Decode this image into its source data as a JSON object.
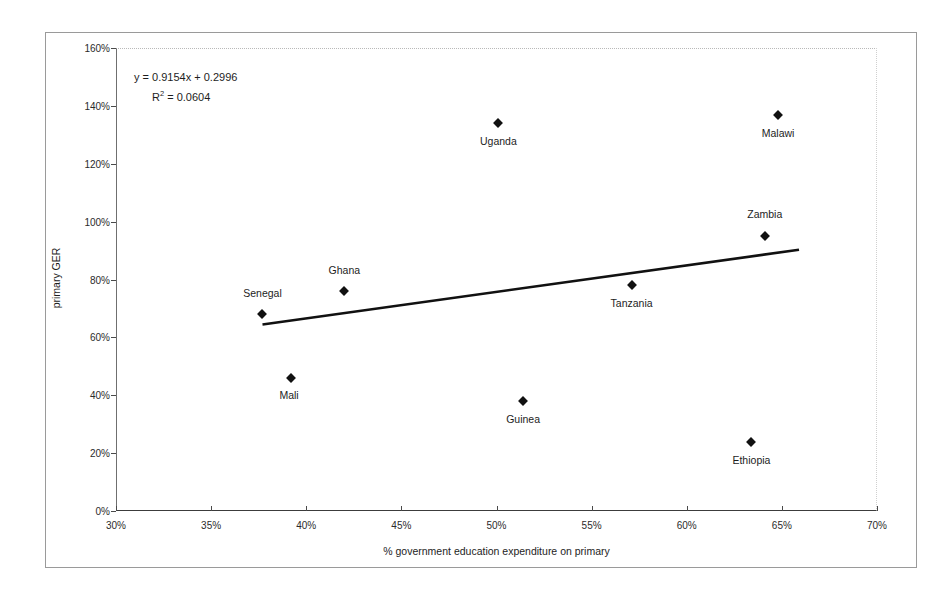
{
  "chart_data": {
    "type": "scatter",
    "title": "",
    "xlabel": "% government education expenditure on primary",
    "ylabel": "primary GER",
    "xlim": [
      30,
      70
    ],
    "ylim": [
      0,
      160
    ],
    "xticks": [
      "30%",
      "35%",
      "40%",
      "45%",
      "50%",
      "55%",
      "60%",
      "65%",
      "70%"
    ],
    "xtick_values": [
      30,
      35,
      40,
      45,
      50,
      55,
      60,
      65,
      70
    ],
    "yticks": [
      "0%",
      "20%",
      "40%",
      "60%",
      "80%",
      "100%",
      "120%",
      "140%",
      "160%"
    ],
    "ytick_values": [
      0,
      20,
      40,
      60,
      80,
      100,
      120,
      140,
      160
    ],
    "grid": false,
    "legend": "none",
    "points": [
      {
        "label": "Senegal",
        "x": 37.7,
        "y": 68,
        "label_dx": 0,
        "label_dy": -20
      },
      {
        "label": "Mali",
        "x": 39.2,
        "y": 46,
        "label_dx": -2,
        "label_dy": 18
      },
      {
        "label": "Ghana",
        "x": 42.0,
        "y": 76,
        "label_dx": 0,
        "label_dy": -20
      },
      {
        "label": "Uganda",
        "x": 50.1,
        "y": 134,
        "label_dx": 0,
        "label_dy": 19
      },
      {
        "label": "Guinea",
        "x": 51.4,
        "y": 38,
        "label_dx": 0,
        "label_dy": 19
      },
      {
        "label": "Tanzania",
        "x": 57.1,
        "y": 78,
        "label_dx": 0,
        "label_dy": 19
      },
      {
        "label": "Ethiopia",
        "x": 63.4,
        "y": 24,
        "label_dx": 0,
        "label_dy": 19
      },
      {
        "label": "Zambia",
        "x": 64.1,
        "y": 95,
        "label_dx": 0,
        "label_dy": -21
      },
      {
        "label": "Malawi",
        "x": 64.8,
        "y": 137,
        "label_dx": 0,
        "label_dy": 19
      }
    ],
    "trendline": {
      "slope": 0.9154,
      "intercept": 0.2996,
      "x_start": 37.7,
      "x_end": 65.9,
      "color": "#111111",
      "width": 2.6
    },
    "annotations": {
      "equation": "y = 0.9154x + 0.2996",
      "r_squared_prefix": "R",
      "r_squared_exponent": "2",
      "r_squared_value": " = 0.0604"
    }
  },
  "colors": {
    "marker": "#111111",
    "trendline": "#111111",
    "axis": "#3c3c3c",
    "frame": "#9a9a9a",
    "text": "#1d1d1d",
    "background": "#ffffff"
  }
}
